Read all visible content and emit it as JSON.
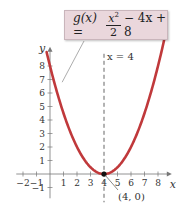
{
  "chart_data": {
    "type": "line",
    "title": "",
    "function": "g(x) = x^2/2 - 4x + 8",
    "xlabel": "x",
    "ylabel": "y",
    "xlim": [
      -2.5,
      8.8
    ],
    "ylim": [
      -1.8,
      9.2
    ],
    "x_ticks": [
      -2,
      -1,
      1,
      2,
      3,
      4,
      5,
      6,
      7,
      8
    ],
    "y_ticks": [
      -1,
      1,
      2,
      3,
      4,
      5,
      6,
      7,
      8
    ],
    "grid": false,
    "series": [
      {
        "name": "g(x)",
        "color": "#c0393b",
        "x": [
          0,
          1,
          2,
          3,
          4,
          5,
          6,
          7,
          8
        ],
        "values": [
          8,
          4.5,
          2,
          0.5,
          0,
          0.5,
          2,
          4.5,
          8
        ]
      }
    ],
    "annotations": [
      {
        "type": "vertical_line",
        "x": 4,
        "style": "dashed",
        "label": "x = 4"
      },
      {
        "type": "point",
        "x": 4,
        "y": 0,
        "label": "(4, 0)"
      },
      {
        "type": "callout",
        "text": "g(x) = x²/2 − 4x + 8",
        "points_to": "curve"
      }
    ]
  },
  "labels": {
    "equation_lhs": "g(x) =",
    "equation_num": "x",
    "equation_num_exp": "2",
    "equation_den": "2",
    "equation_rhs": "− 4x + 8",
    "axis_of_symmetry": "x = 4",
    "vertex": "(4, 0)",
    "x_axis": "x",
    "y_axis": "y"
  },
  "colors": {
    "curve": "#c0393b",
    "callout_bg": "#ead7dc",
    "axis": "#777777",
    "vertex_point": "#111111"
  }
}
